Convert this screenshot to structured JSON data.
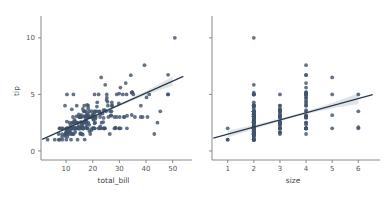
{
  "figure": {
    "background_color": "#ffffff",
    "point_color": "#41546e",
    "line_color": "#2b3a4d",
    "band_color": "#9aa4b0",
    "axis_color": "#8a8a8a"
  },
  "chart_data": [
    {
      "type": "scatter",
      "panel": "left",
      "title": "",
      "xlabel": "total_bill",
      "ylabel": "tip",
      "xlim": [
        0.6,
        55.0
      ],
      "ylim": [
        -0.8,
        11.4
      ],
      "xticks": [
        10,
        20,
        30,
        40,
        50
      ],
      "yticks": [
        0,
        5,
        10
      ],
      "grid": false,
      "legend": "none",
      "regression": {
        "show": true,
        "intercept": 0.92,
        "slope": 0.105,
        "ci": 95,
        "ci_halfwidth_at_xmin": 0.2,
        "ci_halfwidth_at_xmid": 0.11,
        "ci_halfwidth_at_xmax": 0.42
      },
      "x": [
        16.99,
        10.34,
        21.01,
        23.68,
        24.59,
        25.29,
        8.77,
        26.88,
        15.04,
        14.78,
        10.27,
        35.26,
        15.42,
        18.43,
        14.83,
        21.58,
        10.33,
        16.29,
        16.97,
        20.65,
        17.92,
        20.29,
        15.77,
        39.42,
        19.82,
        17.81,
        13.37,
        12.69,
        21.7,
        19.65,
        9.55,
        18.35,
        15.06,
        20.69,
        17.78,
        24.06,
        16.31,
        16.93,
        18.69,
        31.27,
        16.04,
        17.46,
        13.94,
        9.68,
        30.4,
        18.29,
        22.23,
        32.4,
        28.55,
        18.04,
        12.54,
        10.29,
        34.81,
        9.94,
        25.56,
        19.49,
        38.01,
        26.41,
        11.24,
        48.27,
        20.29,
        13.81,
        11.02,
        18.29,
        17.59,
        20.08,
        16.45,
        3.07,
        20.23,
        15.01,
        12.02,
        17.07,
        26.86,
        25.28,
        14.73,
        10.51,
        17.92,
        27.2,
        22.76,
        17.29,
        19.44,
        16.66,
        10.07,
        32.68,
        15.98,
        34.83,
        13.03,
        18.28,
        24.71,
        21.16,
        28.97,
        22.49,
        5.75,
        16.32,
        22.75,
        40.17,
        27.28,
        12.03,
        21.01,
        12.46,
        11.35,
        15.38,
        44.3,
        22.42,
        20.92,
        15.36,
        20.49,
        25.21,
        18.24,
        14.31,
        14.0,
        7.25,
        38.07,
        23.95,
        25.71,
        17.31,
        29.93,
        10.65,
        12.43,
        24.08,
        11.69,
        13.42,
        14.26,
        15.95,
        12.48,
        29.8,
        8.52,
        14.52,
        11.38,
        22.82,
        19.08,
        20.27,
        11.17,
        12.26,
        18.26,
        8.51,
        10.33,
        14.15,
        16.0,
        13.16,
        17.47,
        34.3,
        41.19,
        27.05,
        16.43,
        8.35,
        18.64,
        11.87,
        9.78,
        7.51,
        14.07,
        13.13,
        17.26,
        24.55,
        19.77,
        29.85,
        48.17,
        25.0,
        13.39,
        16.49,
        21.5,
        12.66,
        16.21,
        13.81,
        17.51,
        24.52,
        20.76,
        31.71,
        10.59,
        10.63,
        50.81,
        15.81,
        7.25,
        31.85,
        16.82,
        32.9,
        17.89,
        14.48,
        9.6,
        34.63,
        34.65,
        23.33,
        45.35,
        23.17,
        40.55,
        20.69,
        20.9,
        30.46,
        18.15,
        23.1,
        15.69,
        19.81,
        28.44,
        15.48,
        16.58,
        7.56,
        10.34,
        43.11,
        13.0,
        13.51,
        18.71,
        12.74,
        13.0,
        16.4,
        20.53,
        16.47,
        26.59,
        38.73,
        24.27,
        12.76,
        30.06,
        25.89,
        48.33,
        13.27,
        28.17,
        12.9,
        28.15,
        11.59,
        7.74,
        30.14,
        12.16,
        13.42,
        8.58,
        15.98,
        13.42,
        16.27,
        10.09,
        20.45,
        13.28,
        22.12,
        24.01,
        15.69,
        11.61,
        10.77,
        15.53,
        10.07,
        12.6,
        32.83,
        35.83,
        29.03,
        27.18,
        22.67,
        17.82,
        18.78
      ],
      "y": [
        1.01,
        1.66,
        3.5,
        3.31,
        3.61,
        4.71,
        2.0,
        3.12,
        1.96,
        3.23,
        1.71,
        5.0,
        1.57,
        3.0,
        3.02,
        3.92,
        1.67,
        3.71,
        3.5,
        3.35,
        4.08,
        2.75,
        2.23,
        7.58,
        3.18,
        2.34,
        2.0,
        2.0,
        4.3,
        3.0,
        1.45,
        2.5,
        3.0,
        2.45,
        3.27,
        3.6,
        2.0,
        3.07,
        2.31,
        5.0,
        2.24,
        2.54,
        3.06,
        1.32,
        5.6,
        3.0,
        5.0,
        6.0,
        2.05,
        3.0,
        2.5,
        2.6,
        5.2,
        1.56,
        4.34,
        3.51,
        3.0,
        1.5,
        1.76,
        6.73,
        3.21,
        2.0,
        1.98,
        3.76,
        2.64,
        3.15,
        2.47,
        1.0,
        2.01,
        2.09,
        1.97,
        3.0,
        3.14,
        5.0,
        2.2,
        1.25,
        3.08,
        4.0,
        3.0,
        2.71,
        1.83,
        3.5,
        2.0,
        5.0,
        2.03,
        5.17,
        2.0,
        4.0,
        5.85,
        3.0,
        3.0,
        3.5,
        1.0,
        2.5,
        3.25,
        4.73,
        4.0,
        1.5,
        3.0,
        1.5,
        2.5,
        3.0,
        2.5,
        3.48,
        2.83,
        1.5,
        2.0,
        4.5,
        3.0,
        1.0,
        4.0,
        1.0,
        4.0,
        2.55,
        4.0,
        3.5,
        5.07,
        1.5,
        2.0,
        2.92,
        2.31,
        1.68,
        2.5,
        2.0,
        2.52,
        4.2,
        1.48,
        2.0,
        2.0,
        2.18,
        1.5,
        2.83,
        1.5,
        2.0,
        3.25,
        1.25,
        2.0,
        2.0,
        2.0,
        2.75,
        2.1,
        6.7,
        5.0,
        3.5,
        2.01,
        2.0,
        3.5,
        1.0,
        1.5,
        2.0,
        2.5,
        2.0,
        2.5,
        2.0,
        2.0,
        2.0,
        5.0,
        3.5,
        2.61,
        2.0,
        3.5,
        2.0,
        2.0,
        2.0,
        3.0,
        2.0,
        2.0,
        3.0,
        1.61,
        2.0,
        10.0,
        3.16,
        1.5,
        3.0,
        4.0,
        3.11,
        2.0,
        2.0,
        4.0,
        5.15,
        3.18,
        2.5,
        3.5,
        6.5,
        3.0,
        5.0,
        2.5,
        2.0,
        2.0,
        2.0,
        3.0,
        3.0,
        2.0,
        2.55,
        2.0,
        1.0,
        5.0,
        1.5,
        2.5,
        2.0,
        3.0,
        2.0,
        2.0,
        2.0,
        3.5,
        2.0,
        3.5,
        3.0,
        2.0,
        5.0,
        2.0,
        3.0,
        5.0,
        2.5,
        2.0,
        1.5,
        3.0,
        1.71,
        2.0,
        3.0,
        3.68,
        2.0,
        1.0,
        1.5,
        2.0,
        1.45,
        1.0,
        2.0,
        2.0,
        2.0,
        2.0,
        2.5,
        2.0,
        2.0,
        3.0,
        1.75,
        3.0,
        2.0,
        3.0,
        5.0,
        4.29,
        2.0,
        2.0,
        1.75,
        3.0
      ]
    },
    {
      "type": "scatter",
      "panel": "right",
      "title": "",
      "xlabel": "size",
      "ylabel": "tip",
      "xlim": [
        0.4,
        6.6
      ],
      "ylim": [
        -0.8,
        11.4
      ],
      "xticks": [
        1,
        2,
        3,
        4,
        5,
        6
      ],
      "yticks": [
        0,
        5,
        10
      ],
      "grid": false,
      "legend": "none",
      "regression": {
        "show": true,
        "intercept": 0.85,
        "slope": 0.63,
        "ci": 95,
        "ci_halfwidth_at_xmin": 0.3,
        "ci_halfwidth_at_xmid": 0.12,
        "ci_halfwidth_at_xmax": 0.48
      },
      "x": [
        2,
        3,
        3,
        2,
        4,
        4,
        2,
        4,
        2,
        2,
        2,
        4,
        2,
        4,
        2,
        2,
        3,
        3,
        3,
        3,
        2,
        2,
        2,
        4,
        2,
        4,
        2,
        2,
        2,
        2,
        2,
        3,
        2,
        3,
        2,
        3,
        3,
        3,
        3,
        3,
        3,
        2,
        2,
        2,
        4,
        2,
        2,
        4,
        2,
        2,
        2,
        2,
        4,
        2,
        4,
        2,
        4,
        3,
        2,
        4,
        2,
        2,
        2,
        2,
        3,
        3,
        2,
        1,
        2,
        2,
        2,
        3,
        4,
        2,
        2,
        2,
        2,
        4,
        2,
        2,
        2,
        2,
        1,
        2,
        2,
        4,
        2,
        2,
        2,
        2,
        2,
        2,
        2,
        3,
        2,
        4,
        2,
        2,
        3,
        2,
        2,
        2,
        3,
        2,
        2,
        2,
        2,
        4,
        2,
        2,
        2,
        1,
        3,
        2,
        3,
        2,
        4,
        2,
        2,
        4,
        2,
        2,
        2,
        2,
        2,
        4,
        2,
        2,
        2,
        2,
        2,
        2,
        4,
        2,
        2,
        2,
        2,
        2,
        2,
        2,
        6,
        4,
        4,
        2,
        2,
        3,
        2,
        2,
        2,
        2,
        2,
        2,
        4,
        3,
        5,
        6,
        4,
        2,
        2,
        4,
        2,
        2,
        2,
        4,
        4,
        4,
        2,
        2,
        3,
        2,
        2,
        5,
        2,
        3,
        2,
        2,
        2,
        4,
        4,
        2,
        3,
        4,
        6,
        5,
        3,
        5,
        3,
        4,
        2,
        2,
        2,
        4,
        2,
        2,
        2,
        2,
        6,
        2,
        2,
        2,
        2,
        2,
        2,
        4,
        3,
        3,
        4,
        2,
        4,
        4,
        2,
        2,
        2,
        2,
        2,
        2,
        4,
        2,
        2,
        2,
        3,
        2,
        2,
        2,
        2,
        2,
        2,
        2,
        2,
        2,
        2,
        2,
        4,
        3,
        3,
        2,
        2,
        2,
        2
      ],
      "y": [
        1.01,
        1.66,
        3.5,
        3.31,
        3.61,
        4.71,
        2.0,
        3.12,
        1.96,
        3.23,
        1.71,
        5.0,
        1.57,
        3.0,
        3.02,
        3.92,
        1.67,
        3.71,
        3.5,
        3.35,
        4.08,
        2.75,
        2.23,
        7.58,
        3.18,
        2.34,
        2.0,
        2.0,
        4.3,
        3.0,
        1.45,
        2.5,
        3.0,
        2.45,
        3.27,
        3.6,
        2.0,
        3.07,
        2.31,
        5.0,
        2.24,
        2.54,
        3.06,
        1.32,
        5.6,
        3.0,
        5.0,
        6.0,
        2.05,
        3.0,
        2.5,
        2.6,
        5.2,
        1.56,
        4.34,
        3.51,
        3.0,
        1.5,
        1.76,
        6.73,
        3.21,
        2.0,
        1.98,
        3.76,
        2.64,
        3.15,
        2.47,
        1.0,
        2.01,
        2.09,
        1.97,
        3.0,
        3.14,
        5.0,
        2.2,
        1.25,
        3.08,
        4.0,
        3.0,
        2.71,
        1.83,
        3.5,
        2.0,
        5.0,
        2.03,
        5.17,
        2.0,
        4.0,
        5.85,
        3.0,
        3.0,
        3.5,
        1.0,
        2.5,
        3.25,
        4.73,
        4.0,
        1.5,
        3.0,
        1.5,
        2.5,
        3.0,
        2.5,
        3.48,
        2.83,
        1.5,
        2.0,
        4.5,
        3.0,
        1.0,
        4.0,
        1.0,
        4.0,
        2.55,
        4.0,
        3.5,
        5.07,
        1.5,
        2.0,
        2.92,
        2.31,
        1.68,
        2.5,
        2.0,
        2.52,
        4.2,
        1.48,
        2.0,
        2.0,
        2.18,
        1.5,
        2.83,
        1.5,
        2.0,
        3.25,
        1.25,
        2.0,
        2.0,
        2.0,
        2.75,
        2.1,
        6.7,
        5.0,
        3.5,
        2.01,
        2.0,
        3.5,
        1.0,
        1.5,
        2.0,
        2.5,
        2.0,
        2.5,
        2.0,
        2.0,
        2.0,
        5.0,
        3.5,
        2.61,
        2.0,
        3.5,
        2.0,
        2.0,
        2.0,
        3.0,
        2.0,
        2.0,
        3.0,
        1.61,
        2.0,
        10.0,
        3.16,
        1.5,
        3.0,
        4.0,
        3.11,
        2.0,
        2.0,
        4.0,
        5.15,
        3.18,
        2.5,
        3.5,
        6.5,
        3.0,
        5.0,
        2.5,
        2.0,
        2.0,
        2.0,
        3.0,
        3.0,
        2.0,
        2.55,
        2.0,
        1.0,
        5.0,
        1.5,
        2.5,
        2.0,
        3.0,
        2.0,
        2.0,
        2.0,
        3.5,
        2.0,
        3.5,
        3.0,
        2.0,
        5.0,
        2.0,
        3.0,
        5.0,
        2.5,
        2.0,
        1.5,
        3.0,
        1.71,
        2.0,
        3.0,
        3.68,
        2.0,
        1.0,
        1.5,
        2.0,
        1.45,
        1.0,
        2.0,
        2.0,
        2.0,
        2.0,
        2.5,
        2.0,
        2.0,
        3.0,
        1.75,
        3.0,
        2.0,
        3.0,
        5.0,
        4.29,
        2.0,
        2.0,
        1.75,
        3.0
      ]
    }
  ]
}
